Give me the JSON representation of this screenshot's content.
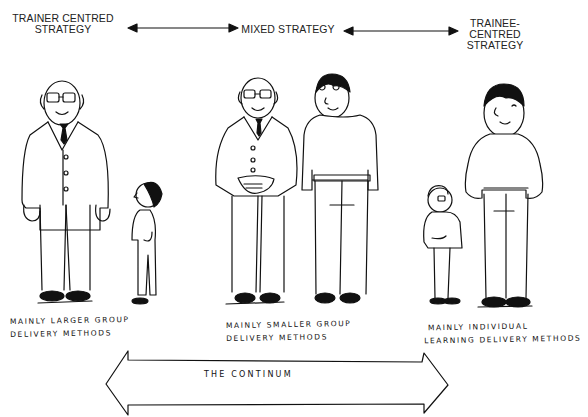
{
  "header": {
    "strategies": [
      {
        "label_lines": [
          "TRAINER CENTRED",
          "STRATEGY"
        ]
      },
      {
        "label_lines": [
          "MIXED STRATEGY"
        ]
      },
      {
        "label_lines": [
          "TRAINEE-",
          "CENTRED",
          "STRATEGY"
        ]
      }
    ]
  },
  "groups": [
    {
      "caption_lines": [
        "MAINLY LARGER GROUP",
        "DELIVERY METHODS"
      ],
      "figures": [
        "large-trainer",
        "small-trainee"
      ]
    },
    {
      "caption_lines": [
        "MAINLY SMALLER GROUP",
        "DELIVERY METHODS"
      ],
      "figures": [
        "trainer",
        "trainee"
      ]
    },
    {
      "caption_lines": [
        "MAINLY INDIVIDUAL",
        "LEARNING DELIVERY METHODS"
      ],
      "figures": [
        "small-trainer",
        "large-trainee"
      ]
    }
  ],
  "continuum": {
    "label": "THE CONTINUM"
  },
  "colors": {
    "ink": "#111111",
    "background": "#ffffff"
  }
}
